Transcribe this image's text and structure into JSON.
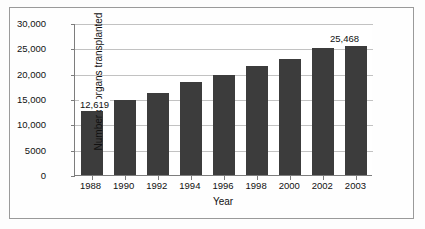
{
  "chart_data": {
    "type": "bar",
    "title": "",
    "xlabel": "Year",
    "ylabel": "Number of organs transplanted",
    "categories": [
      "1988",
      "1990",
      "1992",
      "1994",
      "1996",
      "1998",
      "2000",
      "2002",
      "2003"
    ],
    "values": [
      12619,
      14900,
      16100,
      18300,
      19800,
      21500,
      22900,
      25000,
      25468
    ],
    "ylim": [
      0,
      30000
    ],
    "ytick_labels": [
      "30,000",
      "25,000",
      "20,000",
      "15,000",
      "10,000",
      "5000",
      "0"
    ],
    "ytick_values": [
      30000,
      25000,
      20000,
      15000,
      10000,
      5000,
      0
    ],
    "grid": true,
    "legend": false,
    "bar_color": "#3c3c3c",
    "gridline_color": "#c2c2c2",
    "axis_color": "#7d7d7d",
    "data_labels": [
      {
        "category": "1988",
        "text": "12,619"
      },
      {
        "category": "2003",
        "text": "25,468"
      }
    ]
  }
}
